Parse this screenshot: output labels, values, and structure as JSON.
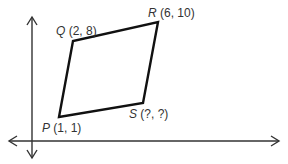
{
  "diagram": {
    "title": "",
    "type": "coordinate-plane-quadrilateral",
    "colors": {
      "axis": "#333333",
      "shape": "#111111",
      "label": "#333333"
    },
    "axes": {
      "x_arrows": "both",
      "y_arrows": "both"
    },
    "points": [
      {
        "name": "Q",
        "coords": "(2, 8)",
        "x": 2,
        "y": 8
      },
      {
        "name": "R",
        "coords": "(6, 10)",
        "x": 6,
        "y": 10
      },
      {
        "name": "S",
        "coords": "(?, ?)",
        "x": null,
        "y": null
      },
      {
        "name": "P",
        "coords": "(1, 1)",
        "x": 1,
        "y": 1
      }
    ],
    "shape": "parallelogram PQRS"
  }
}
